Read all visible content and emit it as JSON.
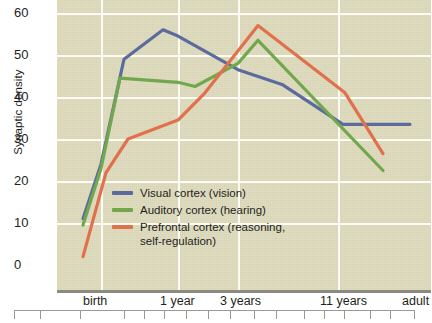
{
  "chart_data": {
    "type": "line",
    "title": "",
    "xlabel": "",
    "ylabel": "Synaptic density",
    "ylim": [
      0,
      63
    ],
    "yticks": [
      0,
      10,
      20,
      30,
      40,
      50,
      60
    ],
    "ytick_labels": [
      "0",
      "10",
      "20",
      "30",
      "40",
      "50",
      "60"
    ],
    "x_tick_labels": [
      "birth",
      "1 year",
      "3 years",
      "11 years",
      "adult"
    ],
    "x_tick_positions": [
      101,
      178,
      238,
      338,
      424
    ],
    "grid": true,
    "legend_position": "center-left",
    "background_color": "#ddd9bb",
    "gridline_color": "#fdfcf4",
    "series": [
      {
        "name": "Visual cortex (vision)",
        "color": "#5c6b9e",
        "points": [
          {
            "x": 83,
            "y": 11
          },
          {
            "x": 101,
            "y": 24
          },
          {
            "x": 124,
            "y": 49
          },
          {
            "x": 163,
            "y": 56
          },
          {
            "x": 178,
            "y": 54.5
          },
          {
            "x": 238,
            "y": 46.5
          },
          {
            "x": 282,
            "y": 43
          },
          {
            "x": 343,
            "y": 33.5
          },
          {
            "x": 410,
            "y": 33.5
          }
        ]
      },
      {
        "name": "Auditory cortex (hearing)",
        "color": "#71a84d",
        "points": [
          {
            "x": 83,
            "y": 9.5
          },
          {
            "x": 101,
            "y": 23
          },
          {
            "x": 120,
            "y": 44.5
          },
          {
            "x": 178,
            "y": 43.5
          },
          {
            "x": 195,
            "y": 42.5
          },
          {
            "x": 238,
            "y": 48
          },
          {
            "x": 258,
            "y": 53.5
          },
          {
            "x": 383,
            "y": 22.5
          }
        ]
      },
      {
        "name": "Prefrontal cortex (reasoning,\nself-regulation)",
        "color": "#e0714c",
        "points": [
          {
            "x": 83,
            "y": 2
          },
          {
            "x": 106,
            "y": 22
          },
          {
            "x": 128,
            "y": 30
          },
          {
            "x": 178,
            "y": 34.5
          },
          {
            "x": 205,
            "y": 41
          },
          {
            "x": 258,
            "y": 57
          },
          {
            "x": 345,
            "y": 41
          },
          {
            "x": 383,
            "y": 26.5
          }
        ]
      }
    ],
    "legend": [
      {
        "label": "Visual cortex (vision)",
        "color": "#5c6b9e"
      },
      {
        "label": "Auditory cortex (hearing)",
        "color": "#71a84d"
      },
      {
        "label": "Prefrontal cortex (reasoning,\nself-regulation)",
        "color": "#e0714c"
      }
    ],
    "ruler_ticks": [
      0,
      26,
      66,
      110,
      130,
      150,
      172,
      194,
      216,
      240,
      262,
      290,
      310,
      330,
      356,
      376,
      400
    ]
  }
}
